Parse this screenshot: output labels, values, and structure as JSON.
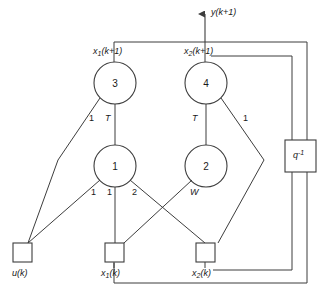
{
  "figure": {
    "type": "neural-network-state-space-block-diagram",
    "output_arrow_label": "y(k+1)",
    "delay_block_label": "q",
    "delay_block_exponent": "-1"
  },
  "neurons": [
    {
      "id": "n3",
      "label": "3",
      "state_label_base": "x",
      "state_label_sub": "1",
      "state_label_tail": "(k+1)"
    },
    {
      "id": "n4",
      "label": "4",
      "state_label_base": "x",
      "state_label_sub": "2",
      "state_label_tail": "(k+1)"
    },
    {
      "id": "n1",
      "label": "1"
    },
    {
      "id": "n2",
      "label": "2"
    }
  ],
  "state_labels": {
    "x1_next": {
      "base": "x",
      "sub": "1",
      "tail": "(k+1)"
    },
    "x2_next": {
      "base": "x",
      "sub": "2",
      "tail": "(k+1)"
    },
    "x1_k": {
      "base": "x",
      "sub": "1",
      "tail": "(k)"
    },
    "x2_k": {
      "base": "x",
      "sub": "2",
      "tail": "(k)"
    },
    "u_k": {
      "base": "u",
      "sub": "",
      "tail": "(k)"
    }
  },
  "inputs": [
    {
      "id": "u",
      "label_base": "u",
      "label_sub": "",
      "label_tail": "(k)"
    },
    {
      "id": "x1",
      "label_base": "x",
      "label_sub": "1",
      "label_tail": "(k)"
    },
    {
      "id": "x2",
      "label_base": "x",
      "label_sub": "2",
      "label_tail": "(k)"
    }
  ],
  "weights": {
    "n3_from_u": "1",
    "n3_from_n1": "T",
    "n4_from_n2": "T",
    "n4_from_x2": "1",
    "n1_from_u": "1",
    "n1_from_x1": "1",
    "n1_from_x2": "2",
    "n2_from_x1": "W"
  },
  "weight_labels": [
    {
      "name": "w-n3-u",
      "text": "1",
      "italic": false
    },
    {
      "name": "w-n3-n1",
      "text": "T",
      "italic": true
    },
    {
      "name": "w-n4-n2",
      "text": "T",
      "italic": true
    },
    {
      "name": "w-n4-x2",
      "text": "1",
      "italic": false
    },
    {
      "name": "w-n1-u",
      "text": "1",
      "italic": false
    },
    {
      "name": "w-n1-x1",
      "text": "1",
      "italic": false
    },
    {
      "name": "w-n1-x2",
      "text": "2",
      "italic": false
    },
    {
      "name": "w-n2-x1",
      "text": "W",
      "italic": true
    }
  ],
  "colors": {
    "stroke": "#3d3d3d",
    "text": "#1a1a1a",
    "background": "#ffffff"
  }
}
